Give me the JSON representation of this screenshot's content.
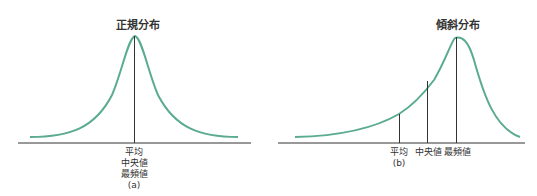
{
  "panel_a": {
    "title": "正規分布",
    "labels": [
      "平均",
      "中央値",
      "最頻値"
    ],
    "caption": "(a)"
  },
  "panel_b": {
    "title": "傾斜分布",
    "label_mean": "平均",
    "label_median": "中央値",
    "label_mode": "最頻値",
    "caption": "(b)"
  },
  "colors": {
    "curve": "#5aab8f",
    "axis": "#333333"
  }
}
